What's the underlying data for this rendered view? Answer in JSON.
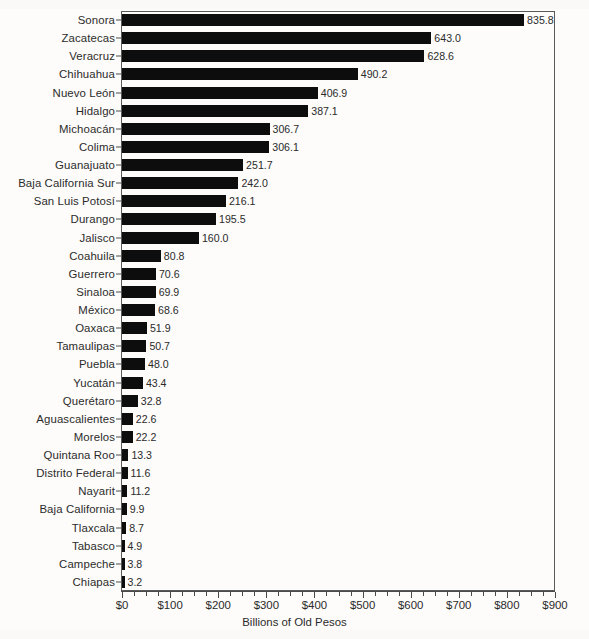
{
  "chart_data": {
    "type": "bar",
    "orientation": "horizontal",
    "title": "",
    "xlabel": "Billions of Old Pesos",
    "ylabel": "",
    "xlim": [
      0,
      900
    ],
    "xticks": [
      0,
      100,
      200,
      300,
      400,
      500,
      600,
      700,
      800,
      900
    ],
    "xtick_labels": [
      "$0",
      "$100",
      "$200",
      "$300",
      "$400",
      "$500",
      "$600",
      "$700",
      "$800",
      "$900"
    ],
    "minor_tick_interval": 25,
    "grid": false,
    "legend": null,
    "bar_color": "#0d0d0d",
    "categories": [
      "Sonora",
      "Zacatecas",
      "Veracruz",
      "Chihuahua",
      "Nuevo León",
      "Hidalgo",
      "Michoacán",
      "Colima",
      "Guanajuato",
      "Baja California Sur",
      "San Luis Potosí",
      "Durango",
      "Jalisco",
      "Coahuila",
      "Guerrero",
      "Sinaloa",
      "México",
      "Oaxaca",
      "Tamaulipas",
      "Puebla",
      "Yucatán",
      "Querétaro",
      "Aguascalientes",
      "Morelos",
      "Quintana Roo",
      "Distrito Federal",
      "Nayarit",
      "Baja California",
      "Tlaxcala",
      "Tabasco",
      "Campeche",
      "Chiapas"
    ],
    "values": [
      835.8,
      643.0,
      628.6,
      490.2,
      406.9,
      387.1,
      306.7,
      306.1,
      251.7,
      242.0,
      216.1,
      195.5,
      160.0,
      80.8,
      70.6,
      69.9,
      68.6,
      51.9,
      50.7,
      48.0,
      43.4,
      32.8,
      22.6,
      22.2,
      13.3,
      11.6,
      11.2,
      9.9,
      8.7,
      4.9,
      3.8,
      3.2
    ],
    "value_labels": [
      "835.8",
      "643.0",
      "628.6",
      "490.2",
      "406.9",
      "387.1",
      "306.7",
      "306.1",
      "251.7",
      "242.0",
      "216.1",
      "195.5",
      "160.0",
      "80.8",
      "70.6",
      "69.9",
      "68.6",
      "51.9",
      "50.7",
      "48.0",
      "43.4",
      "32.8",
      "22.6",
      "22.2",
      "13.3",
      "11.6",
      "11.2",
      "9.9",
      "8.7",
      "4.9",
      "3.8",
      "3.2"
    ]
  }
}
